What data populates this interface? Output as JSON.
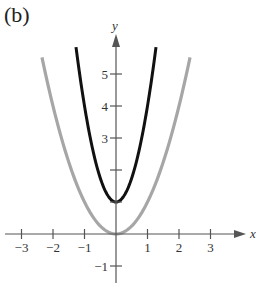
{
  "panel_label": "(b)",
  "chart_data": {
    "type": "line",
    "title": "(b)",
    "xlabel": "x",
    "ylabel": "y",
    "xlim": [
      -3.6,
      3.9
    ],
    "ylim": [
      -1.5,
      5.9
    ],
    "grid": false,
    "legend": null,
    "x_ticks": [
      -3,
      -2,
      -1,
      1,
      2,
      3
    ],
    "x_tick_labels": [
      "−3",
      "−2",
      "−1",
      "1",
      "2",
      "3"
    ],
    "y_ticks": [
      -1,
      1,
      2,
      3,
      4,
      5
    ],
    "y_tick_labels": [
      "−1",
      "",
      "",
      "3",
      "4",
      "5"
    ],
    "series": [
      {
        "name": "gray parabola",
        "equation": "y = x^2",
        "color": "#a6a6a6",
        "x": [
          -2.35,
          -2,
          -1.5,
          -1,
          -0.5,
          0,
          0.5,
          1,
          1.5,
          2,
          2.35
        ],
        "y": [
          5.52,
          4,
          2.25,
          1,
          0.25,
          0,
          0.25,
          1,
          2.25,
          4,
          5.52
        ]
      },
      {
        "name": "black parabola",
        "equation": "y = 3x^2 + 1",
        "color": "#111111",
        "x": [
          -1.27,
          -1,
          -0.5,
          0,
          0.5,
          1,
          1.27
        ],
        "y": [
          5.84,
          4,
          1.75,
          1,
          1.75,
          4,
          5.84
        ]
      }
    ]
  }
}
